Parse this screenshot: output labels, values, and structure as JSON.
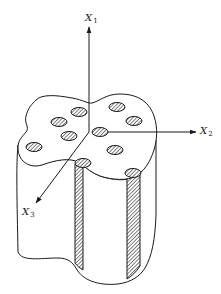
{
  "figure": {
    "type": "3d-schematic",
    "ink_color": "#1a1a1a",
    "background": "#ffffff",
    "axes": [
      {
        "name": "x1",
        "symbol": "X",
        "subscript": "1",
        "direction": "up"
      },
      {
        "name": "x2",
        "symbol": "X",
        "subscript": "2",
        "direction": "right"
      },
      {
        "name": "x3",
        "symbol": "X",
        "subscript": "3",
        "direction": "down-left"
      }
    ],
    "origin": [
      89,
      132
    ],
    "fiber_count_top_face": 9,
    "fibers": [
      {
        "cx": 79,
        "cy": 112
      },
      {
        "cx": 117,
        "cy": 107
      },
      {
        "cx": 59,
        "cy": 122
      },
      {
        "cx": 134,
        "cy": 121
      },
      {
        "cx": 69,
        "cy": 136
      },
      {
        "cx": 100,
        "cy": 132
      },
      {
        "cx": 34,
        "cy": 147
      },
      {
        "cx": 115,
        "cy": 150
      },
      {
        "cx": 83,
        "cy": 163
      },
      {
        "cx": 133,
        "cy": 173
      }
    ],
    "exposed_fibers_on_side": 2
  }
}
